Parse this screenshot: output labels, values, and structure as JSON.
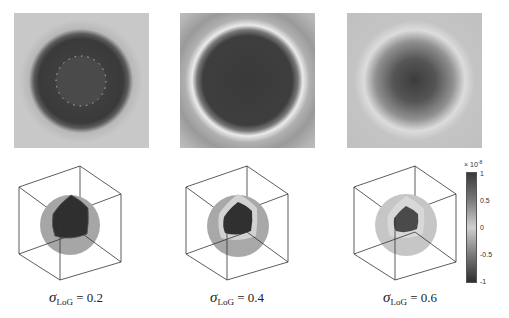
{
  "figure": {
    "panels": [
      {
        "id": "a",
        "sigma_label": "σ",
        "sub": "LoG",
        "value_text": " = 0.2",
        "sigma": 0.2
      },
      {
        "id": "b",
        "sigma_label": "σ",
        "sub": "LoG",
        "value_text": " = 0.4",
        "sigma": 0.4
      },
      {
        "id": "c",
        "sigma_label": "σ",
        "sub": "LoG",
        "value_text": " = 0.6",
        "sigma": 0.6
      }
    ],
    "colorbar": {
      "exponent_base": "× 10",
      "exponent_power": "-8",
      "ticks": [
        "1",
        "0.5",
        "0",
        "-0.5",
        "-1"
      ],
      "range": [
        -1,
        1
      ],
      "colormap": "grayscale: dark at extremes, light at 0"
    },
    "colors": {
      "background_field": "#c8c8c8",
      "dark_core": "#3c3c3c",
      "bright_ring": "#e8e8e8",
      "cube_edge": "#333333"
    }
  }
}
